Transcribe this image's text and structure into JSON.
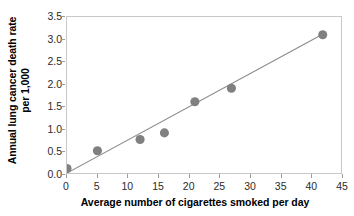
{
  "chart_data": {
    "type": "scatter",
    "title": "",
    "xlabel": "Average number of cigarettes smoked per day",
    "ylabel_line1": "Annual lung cancer death rate",
    "ylabel_line2": "per 1,000",
    "xlim": [
      0,
      45
    ],
    "ylim": [
      0.0,
      3.5
    ],
    "xticks": [
      0,
      5,
      10,
      15,
      20,
      25,
      30,
      35,
      40,
      45
    ],
    "xtick_labels": [
      "0",
      "5",
      "10",
      "15",
      "20",
      "25",
      "30",
      "35",
      "40",
      "45"
    ],
    "yticks": [
      0.0,
      0.5,
      1.0,
      1.5,
      2.0,
      2.5,
      3.0,
      3.5
    ],
    "ytick_labels": [
      "0.0",
      "0.5",
      "1.0",
      "1.5",
      "2.0",
      "2.5",
      "3.0",
      "3.5"
    ],
    "grid": false,
    "legend": "none",
    "points": [
      {
        "x": 0,
        "y": 0.1
      },
      {
        "x": 5,
        "y": 0.5
      },
      {
        "x": 12,
        "y": 0.75
      },
      {
        "x": 16,
        "y": 0.9
      },
      {
        "x": 21,
        "y": 1.6
      },
      {
        "x": 27,
        "y": 1.9
      },
      {
        "x": 42,
        "y": 3.1
      }
    ],
    "trend_line": {
      "x_start": 0,
      "y_start": 0.0,
      "x_end": 42.5,
      "y_end": 3.15
    },
    "marker_color": "#808080",
    "marker_radius": 4.6,
    "line_color": "#8a8a8a",
    "border_color": "#c8c8c8",
    "tick_color": "#9a9a9a",
    "text_color": "#000000"
  }
}
